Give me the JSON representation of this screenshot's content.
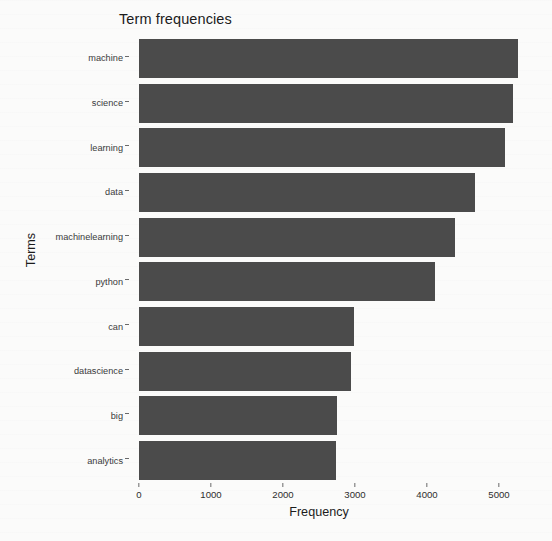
{
  "chart_data": {
    "type": "bar",
    "orientation": "horizontal",
    "title": "Term frequencies",
    "xlabel": "Frequency",
    "ylabel": "Terms",
    "categories": [
      "machine",
      "science",
      "learning",
      "data",
      "machinelearning",
      "python",
      "can",
      "datascience",
      "big",
      "analytics"
    ],
    "values": [
      5270,
      5190,
      5090,
      4660,
      4390,
      4110,
      2980,
      2940,
      2750,
      2730
    ],
    "xlim": [
      0,
      5000
    ],
    "xticks": [
      0,
      1000,
      2000,
      3000,
      4000,
      5000
    ],
    "xtick_labels": [
      "0",
      "1000",
      "2000",
      "3000",
      "4000",
      "5000"
    ],
    "yticks": [
      "machine",
      "science",
      "learning",
      "data",
      "machinelearning",
      "python",
      "can",
      "datascience",
      "big",
      "analytics"
    ],
    "grid": false,
    "legend": null,
    "bar_color": "#4b4b4b",
    "background_color": "#fbfbfa"
  },
  "axis": {
    "x_title": "Frequency",
    "y_title": "Terms"
  }
}
